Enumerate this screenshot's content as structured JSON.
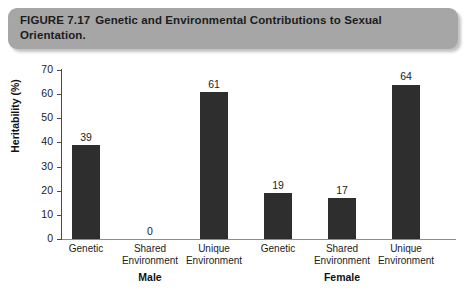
{
  "caption": {
    "figure_number": "FIGURE 7.17",
    "title": "Genetic and Environmental Contributions to Sexual Orientation."
  },
  "chart_data": {
    "type": "bar",
    "title": "Genetic and Environmental Contributions to Sexual Orientation.",
    "xlabel": "",
    "ylabel": "Heritability (%)",
    "ylim": [
      0,
      70
    ],
    "yticks": [
      "0",
      "10",
      "20",
      "30",
      "40",
      "50",
      "60",
      "70"
    ],
    "grid": false,
    "legend": false,
    "categories": [
      "Genetic",
      "Shared Environment",
      "Unique Environment",
      "Genetic",
      "Shared Environment",
      "Unique Environment"
    ],
    "values": [
      39,
      0,
      61,
      19,
      17,
      64
    ],
    "value_labels": [
      "39",
      "0",
      "61",
      "19",
      "17",
      "64"
    ],
    "groups": [
      {
        "label": "Male",
        "categories": [
          "Genetic",
          "Shared Environment",
          "Unique Environment"
        ],
        "values": [
          39,
          0,
          61
        ]
      },
      {
        "label": "Female",
        "categories": [
          "Genetic",
          "Shared Environment",
          "Unique Environment"
        ],
        "values": [
          19,
          17,
          64
        ]
      }
    ],
    "bar_color": "#2e2e2e"
  },
  "axis": {
    "y_title": "Heritability (%)"
  },
  "category_lines": [
    {
      "line1": "Genetic",
      "line2": ""
    },
    {
      "line1": "Shared",
      "line2": "Environment"
    },
    {
      "line1": "Unique",
      "line2": "Environment"
    },
    {
      "line1": "Genetic",
      "line2": ""
    },
    {
      "line1": "Shared",
      "line2": "Environment"
    },
    {
      "line1": "Unique",
      "line2": "Environment"
    }
  ],
  "group_labels": [
    {
      "label": "Male"
    },
    {
      "label": "Female"
    }
  ]
}
